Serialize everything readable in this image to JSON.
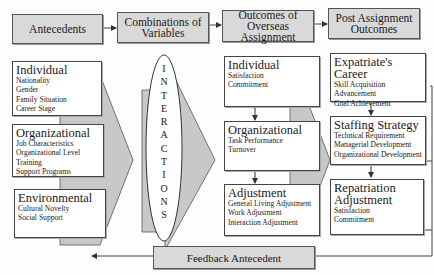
{
  "headers": [
    {
      "label": "Antecedents"
    },
    {
      "label": "Combinations of Variables"
    },
    {
      "label": "Outcomes of Overseas Assignment"
    },
    {
      "label": "Post Assignment Outcomes"
    }
  ],
  "antecedents": [
    {
      "title": "Individual",
      "items": [
        "Nationality",
        "Gender",
        "Family Situation",
        "Career Stage"
      ]
    },
    {
      "title": "Organizational",
      "items": [
        "Job Characteristics",
        "Organizational Level",
        "Training",
        "Support Programs"
      ]
    },
    {
      "title": "Environmental",
      "items": [
        "Cultural Novelty",
        "Social Support"
      ]
    }
  ],
  "interactions": {
    "letters": [
      "I",
      "N",
      "T",
      "E",
      "R",
      "A",
      "C",
      "T",
      "I",
      "O",
      "N",
      "S"
    ]
  },
  "outcomes": [
    {
      "title": "Individual",
      "items": [
        "Satisfaction",
        "Commitment"
      ]
    },
    {
      "title": "Organizational",
      "items": [
        "Task Performance",
        "Turnover"
      ]
    },
    {
      "title": "Adjustment",
      "items": [
        "General Living Adjustment",
        "Work Adjustment",
        "Interaction Adjustment"
      ]
    }
  ],
  "post_outcomes": [
    {
      "title": "Expatriate's Career",
      "items": [
        "Skill Acquisition",
        "Advancement",
        "Goal Achievement"
      ]
    },
    {
      "title": "Staffing Strategy",
      "items": [
        "Technical Requirement",
        "Managerial Development",
        "Organizational Development"
      ]
    },
    {
      "title": "Repatriation Adjustment",
      "items": [
        "Satisfaction",
        "Commitment"
      ]
    }
  ],
  "feedback": {
    "label": "Feedback Antecedent"
  },
  "colors": {
    "header_fill": "#d9d9d9",
    "arrow_fill": "#c8c8c8",
    "line": "#444444"
  }
}
